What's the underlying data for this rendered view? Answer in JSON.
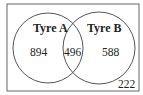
{
  "diagram": {
    "type": "venn",
    "sets": [
      {
        "label": "Tyre A",
        "only": "894"
      },
      {
        "label": "Tyre B",
        "only": "588"
      }
    ],
    "intersection": "496",
    "outside": "222",
    "colors": {
      "stroke": "#555555",
      "background": "#ffffff",
      "text": "#222222"
    }
  }
}
